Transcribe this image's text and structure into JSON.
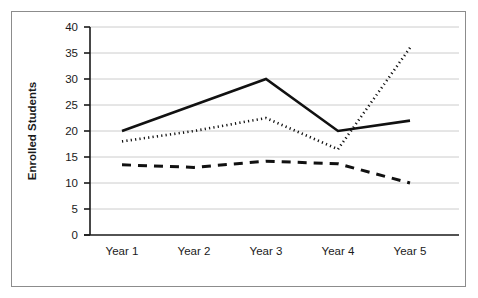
{
  "chart_data": {
    "type": "line",
    "title": "",
    "xlabel": "",
    "ylabel": "Enrolled Students",
    "categories": [
      "Year 1",
      "Year 2",
      "Year 3",
      "Year 4",
      "Year 5"
    ],
    "ylim": [
      0,
      40
    ],
    "yticks": [
      0,
      5,
      10,
      15,
      20,
      25,
      30,
      35,
      40
    ],
    "ytick_labels": [
      "0",
      "5",
      "10",
      "15",
      "20",
      "25",
      "30",
      "35",
      "40"
    ],
    "grid": true,
    "grid_color": "#cccccc",
    "legend": "none",
    "line_color": "#111111",
    "series": [
      {
        "name": "solid-series",
        "style": "solid",
        "values": [
          20,
          25,
          30,
          20,
          22
        ]
      },
      {
        "name": "dotted-series",
        "style": "dotted",
        "values": [
          18,
          20,
          22.5,
          16.5,
          36
        ]
      },
      {
        "name": "dashed-series",
        "style": "dashed",
        "values": [
          13.5,
          13,
          14.2,
          13.7,
          10
        ]
      }
    ]
  },
  "axis": {
    "y_title": "Enrolled Students",
    "y_labels": [
      "40",
      "35",
      "30",
      "25",
      "20",
      "15",
      "10",
      "5",
      "0"
    ],
    "x_labels": [
      "Year 1",
      "Year 2",
      "Year 3",
      "Year 4",
      "Year 5"
    ]
  }
}
